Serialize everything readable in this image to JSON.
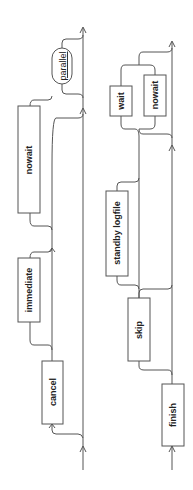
{
  "title": "Finish",
  "diagram": {
    "type": "railroad",
    "orientation": "rotated-90-ccw",
    "rows": [
      {
        "name": "row1",
        "items": [
          {
            "label": "cancel",
            "kind": "optional-choice"
          },
          {
            "label": "immediate",
            "kind": "optional-choice"
          },
          {
            "label": "nowait",
            "kind": "optional"
          },
          {
            "label": "parallel",
            "kind": "optional-reference"
          }
        ]
      },
      {
        "name": "row2",
        "items": [
          {
            "label": "finish",
            "kind": "required"
          },
          {
            "label": "skip",
            "kind": "optional"
          },
          {
            "label": "standby logfile",
            "kind": "optional"
          },
          {
            "label": "wait",
            "kind": "choice"
          },
          {
            "label": "nowait",
            "kind": "choice"
          }
        ]
      }
    ]
  }
}
